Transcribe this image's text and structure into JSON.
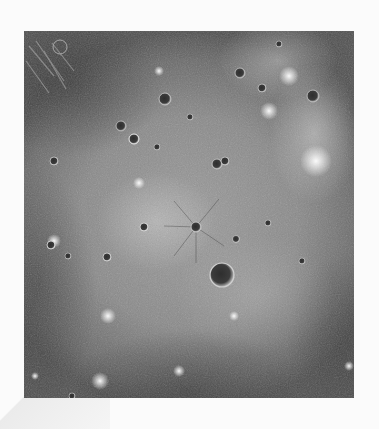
{
  "image": {
    "subject": "Grayscale orbital image of a large impact basin on Mercury's cratered surface",
    "palette": {
      "background": "#fbfbfb",
      "surface_mid": "#8a8a8a",
      "surface_dark": "#505050",
      "surface_bright": "#dcdcdc"
    }
  }
}
